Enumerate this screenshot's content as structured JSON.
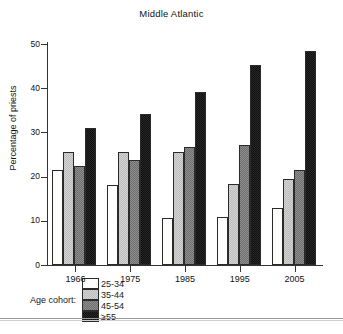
{
  "chart_data": {
    "type": "bar",
    "title": "Middle Atlantic",
    "xlabel": "",
    "ylabel": "Percentage of priests",
    "categories": [
      "1966",
      "1975",
      "1985",
      "1995",
      "2005"
    ],
    "ylim": [
      0,
      50
    ],
    "yticks": [
      "0",
      "10",
      "20",
      "30",
      "40",
      "50"
    ],
    "grid": false,
    "legend_position": "bottom",
    "legend_title": "Age cohort:",
    "series": [
      {
        "name": "25-34",
        "color": "#fdfdfb",
        "values": [
          21.5,
          18.2,
          10.7,
          10.8,
          12.9
        ]
      },
      {
        "name": "35-44",
        "color": "#d2d2d2",
        "values": [
          25.5,
          25.5,
          25.5,
          18.3,
          19.4
        ]
      },
      {
        "name": "45-54",
        "color": "#8d8d8d",
        "values": [
          22.5,
          23.7,
          26.7,
          27.2,
          21.4
        ]
      },
      {
        "name": "≥55",
        "color": "#262626",
        "values": [
          31.1,
          34.2,
          39.2,
          45.2,
          48.4
        ]
      }
    ]
  }
}
